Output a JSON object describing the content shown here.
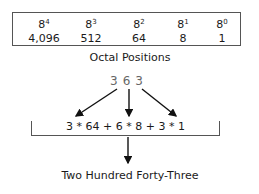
{
  "positions": [
    {
      "base": "8",
      "exp": "4",
      "value": "4,096"
    },
    {
      "base": "8",
      "exp": "3",
      "value": "512"
    },
    {
      "base": "8",
      "exp": "2",
      "value": "64"
    },
    {
      "base": "8",
      "exp": "1",
      "value": "8"
    },
    {
      "base": "8",
      "exp": "0",
      "value": "1"
    }
  ],
  "positions_label": "Octal Positions",
  "octal_number": "363",
  "expression": "3 * 64 + 6 * 8 + 3 * 1",
  "result": "Two Hundred Forty-Three"
}
